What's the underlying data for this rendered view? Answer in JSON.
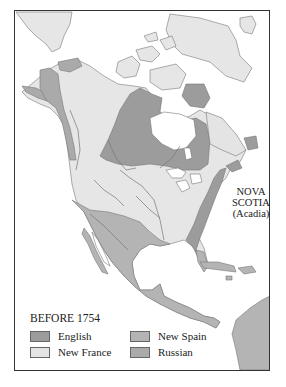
{
  "map": {
    "title": "BEFORE 1754",
    "annotation": {
      "line1": "NOVA",
      "line2": "SCOTIA",
      "line3": "(Acadia)"
    },
    "legend": [
      {
        "label": "English",
        "color": "#9c9c9c"
      },
      {
        "label": "New France",
        "color": "#e4e4e4"
      },
      {
        "label": "New Spain",
        "color": "#b4b4b4"
      },
      {
        "label": "Russian",
        "color": "#aaaaaa"
      }
    ],
    "colors": {
      "land": "#e6e6e6",
      "english": "#9c9c9c",
      "new_france": "#e4e4e4",
      "new_spain": "#b4b4b4",
      "russian": "#aaaaaa",
      "water": "#ffffff",
      "border": "#777777"
    }
  }
}
